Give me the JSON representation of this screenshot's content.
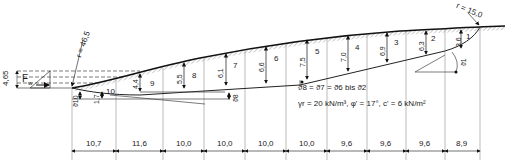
{
  "diagram": {
    "radius_top": "r = 15,0",
    "radius_left": "r = 46,5",
    "water_height": "4,65",
    "water_force": "F",
    "water_force_sub": "w",
    "slice_labels": [
      "1",
      "2",
      "3",
      "4",
      "5",
      "6",
      "7",
      "8",
      "9",
      "10"
    ],
    "slice_heights": [
      "3,6",
      "6,3",
      "6,9",
      "7,0",
      "7,5",
      "6,6",
      "6,1",
      "5,5",
      "4,4",
      "1,7"
    ],
    "angle_labels": {
      "theta1": "ϑ1",
      "theta8": "ϑ8",
      "theta9": "ϑ9",
      "theta10": "ϑ10"
    },
    "angle_note": "ϑ8 = ϑ7 = ϑ6 bis ϑ2",
    "soil_note": "γr = 20 kN/m³, φ' = 17°, c' = 6 kN/m²",
    "dimensions": [
      "10,7",
      "11,6",
      "10,0",
      "10,0",
      "10,0",
      "10,0",
      "9,6",
      "9,6",
      "9,6",
      "8,9"
    ],
    "colors": {
      "line": "#111111",
      "thin": "#444444",
      "grid": "#999999",
      "hatch": "#aaaaaa",
      "background": "#ffffff"
    }
  }
}
